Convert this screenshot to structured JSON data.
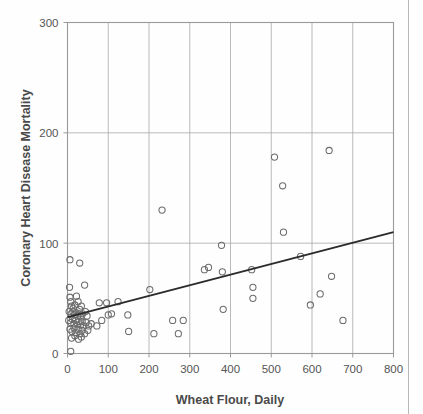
{
  "chart_data": {
    "type": "scatter",
    "title": "",
    "xlabel": "Wheat Flour, Daily",
    "ylabel": "Coronary Heart Disease Mortality",
    "xlim": [
      0,
      800
    ],
    "ylim": [
      0,
      300
    ],
    "xticks": [
      0,
      100,
      200,
      300,
      400,
      500,
      600,
      700,
      800
    ],
    "yticks": [
      0,
      100,
      200,
      300
    ],
    "xtick_labels": [
      "0",
      "100",
      "200",
      "300",
      "400",
      "500",
      "600",
      "700",
      "800"
    ],
    "ytick_labels": [
      "0",
      "100",
      "200",
      "300"
    ],
    "grid": true,
    "legend": "none",
    "marker": "open-circle",
    "marker_color": "#6b6b6b",
    "line_color": "#2b2b2b",
    "axis_color": "#9a9a9a",
    "grid_color": "#a8a8a8",
    "points": [
      [
        6,
        85
      ],
      [
        30,
        82
      ],
      [
        5,
        60
      ],
      [
        42,
        62
      ],
      [
        6,
        51
      ],
      [
        8,
        47
      ],
      [
        22,
        52
      ],
      [
        26,
        47
      ],
      [
        10,
        43
      ],
      [
        14,
        41
      ],
      [
        18,
        44
      ],
      [
        30,
        40
      ],
      [
        34,
        43
      ],
      [
        4,
        38
      ],
      [
        9,
        36
      ],
      [
        13,
        38
      ],
      [
        17,
        35
      ],
      [
        21,
        37
      ],
      [
        25,
        34
      ],
      [
        29,
        36
      ],
      [
        33,
        33
      ],
      [
        37,
        36
      ],
      [
        44,
        38
      ],
      [
        48,
        34
      ],
      [
        3,
        30
      ],
      [
        8,
        28
      ],
      [
        12,
        31
      ],
      [
        16,
        27
      ],
      [
        20,
        30
      ],
      [
        24,
        26
      ],
      [
        28,
        29
      ],
      [
        32,
        26
      ],
      [
        36,
        29
      ],
      [
        40,
        25
      ],
      [
        46,
        28
      ],
      [
        52,
        25
      ],
      [
        58,
        27
      ],
      [
        6,
        22
      ],
      [
        11,
        20
      ],
      [
        16,
        23
      ],
      [
        21,
        19
      ],
      [
        26,
        22
      ],
      [
        31,
        18
      ],
      [
        36,
        21
      ],
      [
        42,
        18
      ],
      [
        50,
        21
      ],
      [
        10,
        14
      ],
      [
        18,
        16
      ],
      [
        27,
        13
      ],
      [
        34,
        15
      ],
      [
        8,
        2
      ],
      [
        72,
        25
      ],
      [
        78,
        46
      ],
      [
        84,
        30
      ],
      [
        96,
        46
      ],
      [
        100,
        35
      ],
      [
        108,
        36
      ],
      [
        124,
        47
      ],
      [
        148,
        35
      ],
      [
        150,
        20
      ],
      [
        202,
        58
      ],
      [
        212,
        18
      ],
      [
        232,
        130
      ],
      [
        258,
        30
      ],
      [
        272,
        18
      ],
      [
        284,
        30
      ],
      [
        336,
        76
      ],
      [
        346,
        78
      ],
      [
        378,
        98
      ],
      [
        380,
        74
      ],
      [
        382,
        40
      ],
      [
        452,
        76
      ],
      [
        455,
        60
      ],
      [
        455,
        50
      ],
      [
        508,
        178
      ],
      [
        528,
        152
      ],
      [
        530,
        110
      ],
      [
        572,
        88
      ],
      [
        596,
        44
      ],
      [
        620,
        54
      ],
      [
        642,
        184
      ],
      [
        648,
        70
      ],
      [
        676,
        30
      ]
    ],
    "trendline": {
      "x0": 0,
      "y0": 33,
      "x1": 800,
      "y1": 110
    }
  }
}
